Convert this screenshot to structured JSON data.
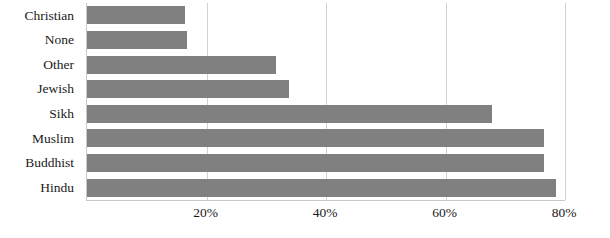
{
  "chart_data": {
    "type": "bar",
    "orientation": "horizontal",
    "title": "",
    "subtitle": "",
    "xlabel": "",
    "ylabel": "",
    "categories": [
      "Christian",
      "None",
      "Other",
      "Jewish",
      "Sikh",
      "Muslim",
      "Buddhist",
      "Hindu"
    ],
    "values": [
      16.4,
      16.7,
      31.6,
      33.8,
      67.8,
      76.5,
      76.5,
      78.5
    ],
    "value_format": "percent",
    "xlim": [
      0,
      80
    ],
    "ylim": null,
    "x_ticks": [
      20,
      40,
      60,
      80
    ],
    "x_tick_labels": [
      "20%",
      "40%",
      "60%",
      "80%"
    ],
    "y_tick_labels": [
      "Christian",
      "None",
      "Other",
      "Jewish",
      "Sikh",
      "Muslim",
      "Buddhist",
      "Hindu"
    ],
    "grid": true,
    "grid_axis": "x",
    "legend": false,
    "legend_position": "none",
    "annotations": [],
    "series": [
      {
        "name": "",
        "values": [
          16.4,
          16.7,
          31.6,
          33.8,
          67.8,
          76.5,
          76.5,
          78.5
        ]
      }
    ],
    "colors": {
      "bar_fill": "#808080",
      "gridline": "#d2d2d2",
      "axis_line": "#c9c9c9",
      "text": "#1a1a1a",
      "background": "#ffffff"
    }
  }
}
